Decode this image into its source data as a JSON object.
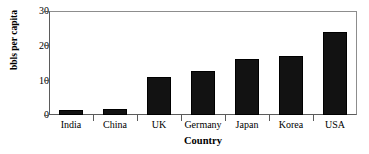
{
  "chart_data": {
    "type": "bar",
    "title": "",
    "subtitle": "",
    "xlabel": "Country",
    "ylabel": "bbls per capita",
    "categories": [
      "India",
      "China",
      "UK",
      "Germany",
      "Japan",
      "Korea",
      "USA"
    ],
    "values": [
      1.4,
      1.8,
      10.9,
      12.6,
      16.3,
      17.1,
      24.0
    ],
    "series": [
      {
        "name": "bbls per capita",
        "values": [
          1.4,
          1.8,
          10.9,
          12.6,
          16.3,
          17.1,
          24.0
        ]
      }
    ],
    "ylim": [
      0,
      30
    ],
    "xlim": [
      0,
      7
    ],
    "ytick_labels": [
      "0",
      "10",
      "20",
      "30"
    ],
    "ytick_values": [
      0,
      10,
      20,
      30
    ],
    "grid": false,
    "legend": false,
    "legend_position": "none",
    "bar_color": "#121212",
    "axis_color": "#5b5b5b",
    "background_color": "#ffffff",
    "annotations": []
  }
}
